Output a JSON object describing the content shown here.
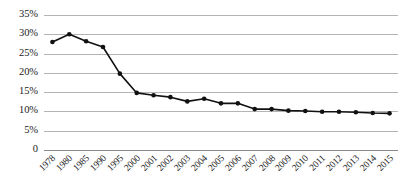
{
  "chart_data": {
    "type": "line",
    "title": "",
    "subtitle": "",
    "xlabel": "",
    "ylabel": "",
    "categories": [
      "1978",
      "1980",
      "1985",
      "1990",
      "1995",
      "2000",
      "2001",
      "2002",
      "2003",
      "2004",
      "2005",
      "2006",
      "2007",
      "2008",
      "2009",
      "2010",
      "2011",
      "2012",
      "2013",
      "2014",
      "2015"
    ],
    "values": [
      28.0,
      30.0,
      28.2,
      26.7,
      19.8,
      14.8,
      14.2,
      13.7,
      12.6,
      13.3,
      12.1,
      12.1,
      10.6,
      10.6,
      10.2,
      10.1,
      9.9,
      9.9,
      9.8,
      9.6,
      9.5
    ],
    "series": [
      {
        "name": "rate",
        "values": [
          28.0,
          30.0,
          28.2,
          26.7,
          19.8,
          14.8,
          14.2,
          13.7,
          12.6,
          13.3,
          12.1,
          12.1,
          10.6,
          10.6,
          10.2,
          10.1,
          9.9,
          9.9,
          9.8,
          9.6,
          9.5
        ]
      }
    ],
    "ylim": [
      0,
      35
    ],
    "ytick_values": [
      35,
      30,
      25,
      20,
      15,
      10,
      5,
      0
    ],
    "ytick_labels": [
      "35%",
      "30%",
      "25%",
      "20%",
      "15%",
      "10%",
      "5%",
      "0"
    ],
    "grid": true,
    "legend": false,
    "legend_position": "none",
    "marker": "filled-circle",
    "line_color": "#111111",
    "marker_color": "#111111",
    "grid_color": "#b4b4b4",
    "axis_color": "#8a8a8a",
    "background_color": "#ffffff"
  }
}
